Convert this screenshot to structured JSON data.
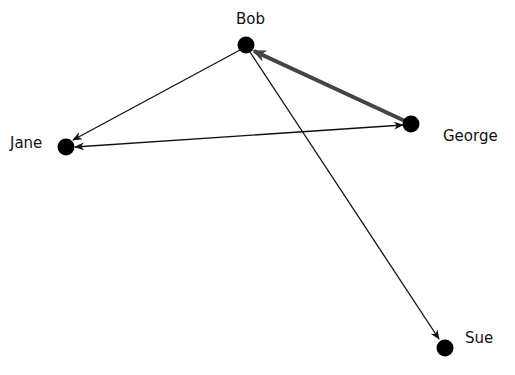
{
  "diagram": {
    "type": "directed-network-graph",
    "nodes": [
      {
        "id": "bob",
        "label": "Bob",
        "x": 246,
        "y": 45,
        "label_x": 236,
        "label_y": 10
      },
      {
        "id": "jane",
        "label": "Jane",
        "x": 66,
        "y": 147,
        "label_x": 10,
        "label_y": 134
      },
      {
        "id": "george",
        "label": "George",
        "x": 411,
        "y": 124,
        "label_x": 443,
        "label_y": 127
      },
      {
        "id": "sue",
        "label": "Sue",
        "x": 445,
        "y": 348,
        "label_x": 465,
        "label_y": 329
      }
    ],
    "edges": [
      {
        "from": "bob",
        "to": "jane",
        "weight": "thin"
      },
      {
        "from": "george",
        "to": "jane",
        "weight": "thin",
        "bidirectional": true
      },
      {
        "from": "george",
        "to": "bob",
        "weight": "thick"
      },
      {
        "from": "bob",
        "to": "sue",
        "weight": "thin"
      }
    ],
    "colors": {
      "node": "#000000",
      "thin_edge": "#111111",
      "thick_edge": "#444444"
    }
  }
}
